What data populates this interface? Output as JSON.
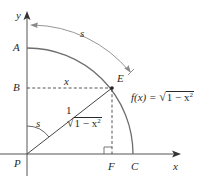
{
  "diagram": {
    "type": "unit-circle-arc-length",
    "colors": {
      "ink": "#2a2a2a",
      "circle": "#6e6e6e",
      "arc_s": "#8a8a8a",
      "axis": "#555555"
    },
    "axes": {
      "x_label": "x",
      "y_label": "y"
    },
    "points": {
      "A": "A",
      "B": "B",
      "C": "C",
      "E": "E",
      "F": "F",
      "P": "P"
    },
    "labels": {
      "arc_s": "s",
      "angle_s": "s",
      "segment_BE": "x",
      "radius_PE": "1",
      "height_EF_radicand": "1 − x",
      "height_EF_exp": "2",
      "function_prefix": "f(x) = ",
      "function_radicand": "1 − x",
      "function_exp": "2"
    }
  }
}
